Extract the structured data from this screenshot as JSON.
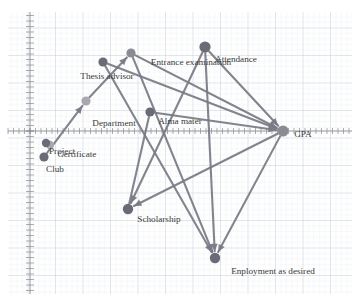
{
  "figure": {
    "kind": "directed-graph",
    "background": "graph-paper",
    "node_color_dark": "#6b6b78",
    "node_color_mid": "#8b8b93",
    "node_color_light": "#a8a8ae",
    "edge_color": "#7a7a86",
    "label_color": "#3a3a3a",
    "grid_minor_color": "#d9dde4",
    "grid_major_color": "#c2c8d2",
    "axis_color": "#8a8a92"
  },
  "axes": {
    "origin_x": 30,
    "origin_y": 131,
    "x_axis_label": "",
    "y_axis_label": "",
    "tick_spacing": 11,
    "grid": true
  },
  "chart_data": {
    "type": "scatter",
    "title": "",
    "xlabel": "",
    "ylabel": "",
    "nodes": [
      {
        "id": "thesis_advisor",
        "label": "Thesis advisor",
        "x": 103,
        "y": 62,
        "r": 4.6,
        "tone": "dark",
        "lx": 107,
        "ly": 79,
        "anchor": "middle"
      },
      {
        "id": "entrance_examination",
        "label": "Entrance examination",
        "x": 131,
        "y": 53,
        "r": 4.6,
        "tone": "mid",
        "lx": 191,
        "ly": 65,
        "anchor": "middle"
      },
      {
        "id": "attendance",
        "label": "Attendance",
        "x": 205,
        "y": 47,
        "r": 5.6,
        "tone": "dark",
        "lx": 236,
        "ly": 62,
        "anchor": "middle"
      },
      {
        "id": "department",
        "label": "Department",
        "x": 86,
        "y": 101,
        "r": 4.6,
        "tone": "light",
        "lx": 114,
        "ly": 126,
        "anchor": "middle"
      },
      {
        "id": "alma_mater",
        "label": "Alma mater",
        "x": 150,
        "y": 112,
        "r": 4.6,
        "tone": "dark",
        "lx": 180,
        "ly": 124,
        "anchor": "middle"
      },
      {
        "id": "gpa",
        "label": "GPA",
        "x": 283,
        "y": 131,
        "r": 5.6,
        "tone": "mid",
        "lx": 303,
        "ly": 137,
        "anchor": "middle"
      },
      {
        "id": "certificate",
        "label": "Certificate",
        "x": 50,
        "y": 145,
        "r": 4.2,
        "tone": "light",
        "lx": 77,
        "ly": 157,
        "anchor": "middle"
      },
      {
        "id": "project",
        "label": "Project",
        "x": 46,
        "y": 143,
        "r": 4.2,
        "tone": "dark",
        "lx": 62,
        "ly": 154,
        "anchor": "middle"
      },
      {
        "id": "club",
        "label": "Club",
        "x": 44,
        "y": 157,
        "r": 4.6,
        "tone": "dark",
        "lx": 55,
        "ly": 172,
        "anchor": "middle"
      },
      {
        "id": "scholarship",
        "label": "Scholarship",
        "x": 128,
        "y": 209,
        "r": 5.2,
        "tone": "dark",
        "lx": 159,
        "ly": 222,
        "anchor": "middle"
      },
      {
        "id": "employment",
        "label": "Enployment as desired",
        "x": 215,
        "y": 258,
        "r": 5.2,
        "tone": "dark",
        "lx": 273,
        "ly": 274,
        "anchor": "middle"
      }
    ],
    "edges": [
      {
        "from": "alma_mater",
        "to": "gpa",
        "arrow": "to"
      },
      {
        "from": "attendance",
        "to": "gpa",
        "arrow": "to"
      },
      {
        "from": "entrance_examination",
        "to": "gpa",
        "arrow": "to"
      },
      {
        "from": "thesis_advisor",
        "to": "gpa",
        "arrow": "to"
      },
      {
        "from": "department",
        "to": "entrance_examination",
        "arrow": "to"
      },
      {
        "from": "club",
        "to": "department",
        "arrow": "to"
      },
      {
        "from": "gpa",
        "to": "scholarship",
        "arrow": "to"
      },
      {
        "from": "gpa",
        "to": "employment",
        "arrow": "to"
      },
      {
        "from": "attendance",
        "to": "employment",
        "arrow": "to"
      },
      {
        "from": "attendance",
        "to": "scholarship",
        "arrow": "to"
      },
      {
        "from": "entrance_examination",
        "to": "employment",
        "arrow": "to"
      },
      {
        "from": "thesis_advisor",
        "to": "employment",
        "arrow": "to"
      },
      {
        "from": "alma_mater",
        "to": "scholarship",
        "arrow": "none"
      }
    ]
  }
}
